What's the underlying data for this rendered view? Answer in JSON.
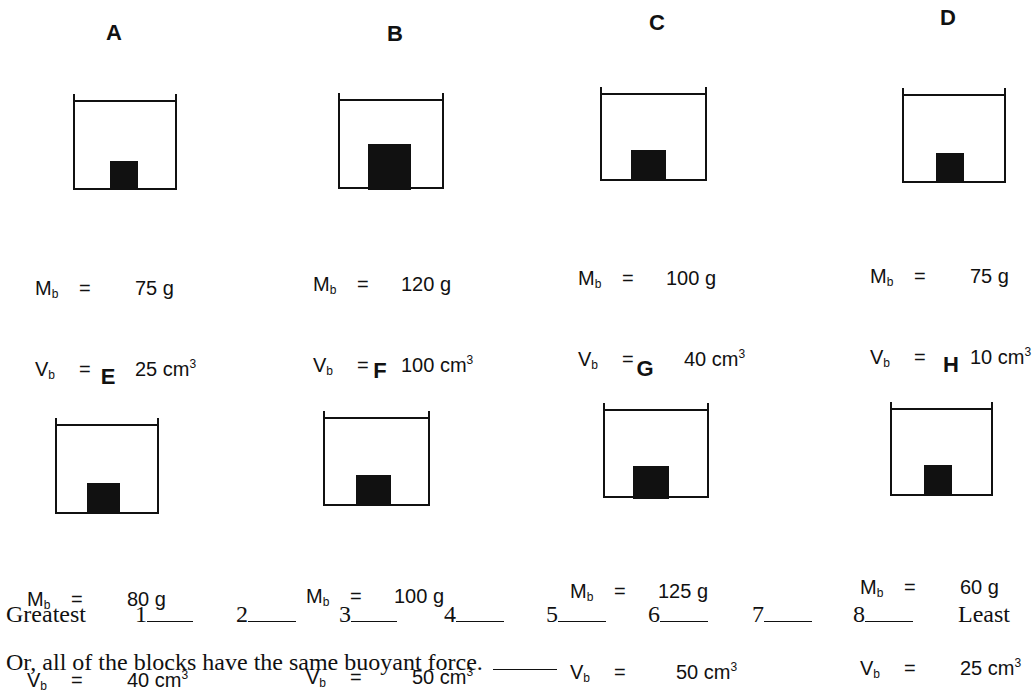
{
  "blocks": [
    {
      "label": "A",
      "mass_symbol": "M",
      "volume_symbol": "V",
      "sub": "b",
      "eq": "=",
      "mass": "75 g",
      "volume": "25 cm",
      "exp": "3"
    },
    {
      "label": "B",
      "mass_symbol": "M",
      "volume_symbol": "V",
      "sub": "b",
      "eq": "=",
      "mass": "120 g",
      "volume": "100 cm",
      "exp": "3"
    },
    {
      "label": "C",
      "mass_symbol": "M",
      "volume_symbol": "V",
      "sub": "b",
      "eq": "=",
      "mass": "100 g",
      "volume": "40 cm",
      "exp": "3"
    },
    {
      "label": "D",
      "mass_symbol": "M",
      "volume_symbol": "V",
      "sub": "b",
      "eq": "=",
      "mass": "75 g",
      "volume": "10 cm",
      "exp": "3"
    },
    {
      "label": "E",
      "mass_symbol": "M",
      "volume_symbol": "V",
      "sub": "b",
      "eq": "=",
      "mass": "80 g",
      "volume": "40 cm",
      "exp": "3"
    },
    {
      "label": "F",
      "mass_symbol": "M",
      "volume_symbol": "V",
      "sub": "b",
      "eq": "=",
      "mass": "100 g",
      "volume": "50 cm",
      "exp": "3"
    },
    {
      "label": "G",
      "mass_symbol": "M",
      "volume_symbol": "V",
      "sub": "b",
      "eq": "=",
      "mass": "125 g",
      "volume": "50 cm",
      "exp": "3"
    },
    {
      "label": "H",
      "mass_symbol": "M",
      "volume_symbol": "V",
      "sub": "b",
      "eq": "=",
      "mass": "60 g",
      "volume": "25 cm",
      "exp": "3"
    }
  ],
  "ranking": {
    "greatest_label": "Greatest",
    "least_label": "Least",
    "slots": [
      "1",
      "2",
      "3",
      "4",
      "5",
      "6",
      "7",
      "8"
    ]
  },
  "same_force_prompt": "Or, all of the blocks have the same buoyant force."
}
